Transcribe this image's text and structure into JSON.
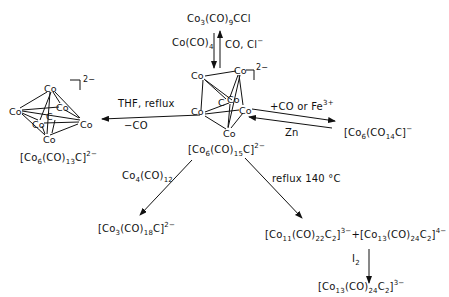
{
  "diagram": {
    "type": "reaction-scheme",
    "central_compound": {
      "label": "[Co6(CO)15C]2-",
      "base": "[Co",
      "n1": "6",
      "mid": "(CO)",
      "n2": "15",
      "end": "C]",
      "charge": "2−"
    },
    "top_compound": {
      "base": "Co",
      "n1": "3",
      "mid": "(CO)",
      "n2": "9",
      "end": "CCl",
      "label": "Co3(CO)9CCl"
    },
    "top_arrow": {
      "down_label": {
        "base": "Co(CO)",
        "sub": "4",
        "text": "Co(CO)4"
      },
      "up_label": {
        "base": "CO, Cl",
        "sup": "−",
        "text": "CO, Cl−"
      }
    },
    "left_compound": {
      "base": "[Co",
      "n1": "6",
      "mid": "(CO)",
      "n2": "13",
      "end": "C]",
      "charge": "2−",
      "label": "[Co6(CO)13C]2-"
    },
    "left_arrow": {
      "top": "THF, reflux",
      "bottom": "−CO"
    },
    "right_compound": {
      "base": "[Co",
      "n1": "6",
      "mid": "(CO",
      "n2": "14",
      "end": "C]",
      "charge": "−",
      "label": "[Co6(CO14C]-"
    },
    "right_arrow": {
      "forward_label": "+CO or Fe",
      "forward_sup": "3+",
      "reverse_label": "Zn"
    },
    "lower_left_arrow": {
      "base": "Co",
      "n1": "4",
      "mid": "(CO)",
      "n2": "12"
    },
    "lower_left_compound": {
      "base": "[Co",
      "n1": "3",
      "mid": "(CO)",
      "n2": "18",
      "end": "C]",
      "charge": "2−",
      "label": "[Co3(CO)18C]2-"
    },
    "lower_right_arrow": {
      "label": "reflux 140 °C"
    },
    "lower_right_products": {
      "p1": {
        "base": "[Co",
        "n1": "11",
        "mid": "(CO)",
        "n2": "22",
        "c": "C",
        "n3": "2",
        "end": "]",
        "charge": "3−"
      },
      "plus": "+",
      "p2": {
        "base": "[Co",
        "n1": "13",
        "mid": "(CO)",
        "n2": "24",
        "c": "C",
        "n3": "2",
        "end": "]",
        "charge": "4−"
      }
    },
    "final_arrow": {
      "base": "I",
      "sub": "2"
    },
    "final_compound": {
      "base": "[Co",
      "n1": "13",
      "mid": "(CO)",
      "n2": "24",
      "c": "C",
      "n3": "2",
      "end": "]",
      "charge": "3−"
    },
    "atom_label": "Co",
    "carbon_label": "C",
    "charge_2minus": "2−"
  }
}
